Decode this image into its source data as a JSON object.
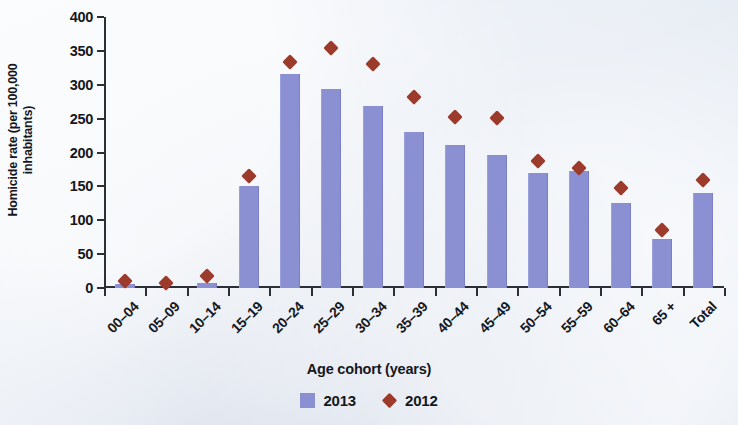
{
  "chart_data": {
    "type": "bar",
    "title": "",
    "xlabel": "Age cohort (years)",
    "ylabel": "Homicide rate (per 100,000\ninhabitants)",
    "ylim": [
      0,
      400
    ],
    "yticks": [
      0,
      50,
      100,
      150,
      200,
      250,
      300,
      350,
      400
    ],
    "grid": false,
    "legend_position": "bottom",
    "categories": [
      "00–04",
      "05–09",
      "10–14",
      "15–19",
      "20–24",
      "25–29",
      "30–34",
      "35–39",
      "40–44",
      "45–49",
      "50–54",
      "55–59",
      "60–64",
      "65 +",
      "Total"
    ],
    "series": [
      {
        "name": "2013",
        "type": "bar",
        "color": "#8b90d2",
        "values": [
          6,
          0,
          8,
          150,
          316,
          294,
          268,
          230,
          211,
          196,
          170,
          173,
          125,
          72,
          140
        ]
      },
      {
        "name": "2012",
        "type": "scatter",
        "marker": "diamond",
        "color": "#9c3b2c",
        "values": [
          5,
          2,
          12,
          160,
          327,
          348,
          325,
          276,
          246,
          245,
          181,
          171,
          142,
          79,
          154
        ]
      }
    ]
  },
  "axes": {
    "y_title": "Homicide rate (per 100,000\ninhabitants)",
    "x_title": "Age cohort (years)",
    "y_tick_labels": [
      "0",
      "50",
      "100",
      "150",
      "200",
      "250",
      "300",
      "350",
      "400"
    ]
  },
  "legend": {
    "items": [
      {
        "label": "2013",
        "marker": "square",
        "color": "#8b90d2"
      },
      {
        "label": "2012",
        "marker": "diamond",
        "color": "#9c3b2c"
      }
    ]
  },
  "colors": {
    "bar_2013": "#8b90d2",
    "marker_2012": "#9c3b2c",
    "axis": "#2b2f38",
    "background": "#e9eef5",
    "text": "#15171c"
  }
}
